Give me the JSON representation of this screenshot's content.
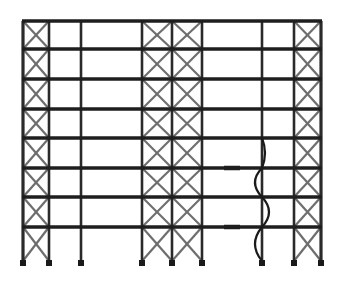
{
  "diagram": {
    "type": "structural-frame-elevation",
    "colors": {
      "beam": "#1e1e1e",
      "column": "#2a2a2a",
      "brace": "#6e6e6e",
      "support": "#1a1a1a",
      "buckled": "#1a1a1a",
      "background": "#ffffff"
    },
    "columns_x": [
      23,
      49,
      81,
      142,
      172,
      202,
      262,
      294,
      321
    ],
    "floors_y": [
      21,
      49,
      79,
      109,
      138,
      168,
      197,
      227
    ],
    "base_y": 261,
    "braced_bays": [
      [
        0,
        1
      ],
      [
        3,
        4
      ],
      [
        4,
        5
      ],
      [
        7,
        8
      ]
    ],
    "buckled_column_index": 6,
    "storey_count": 8,
    "bay_count": 8
  }
}
